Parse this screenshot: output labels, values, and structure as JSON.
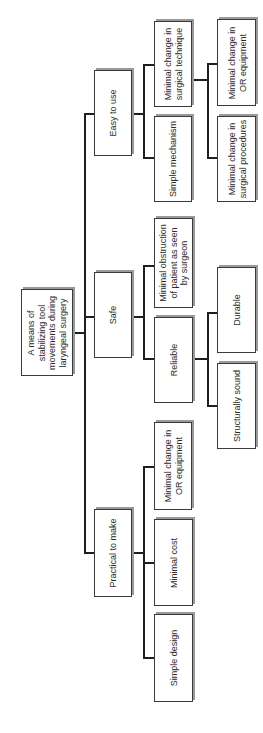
{
  "diagram": {
    "title": "A means of stabilizing tool movements during laryngeal surgery",
    "nodes": [
      {
        "id": "root",
        "label": "A means of\nstabilizing tool\nmovements during\nlaryngeal surgery",
        "x": 21,
        "y": 289,
        "w": 52,
        "h": 87
      },
      {
        "id": "easy",
        "label": "Easy to use",
        "x": 94,
        "y": 70,
        "w": 38,
        "h": 86
      },
      {
        "id": "safe",
        "label": "Safe",
        "x": 94,
        "y": 272,
        "w": 38,
        "h": 86
      },
      {
        "id": "practical",
        "label": "Practical to make",
        "x": 94,
        "y": 509,
        "w": 38,
        "h": 88
      },
      {
        "id": "technique",
        "label": "Minimal change in\nsurgical technique",
        "x": 154,
        "y": 21,
        "w": 38,
        "h": 86
      },
      {
        "id": "mechanism",
        "label": "Simple mechanism",
        "x": 154,
        "y": 116,
        "w": 38,
        "h": 86
      },
      {
        "id": "obstruction",
        "label": "Minimal obstruction\nof patient as seen\nby surgeon",
        "x": 154,
        "y": 218,
        "w": 39,
        "h": 90
      },
      {
        "id": "reliable",
        "label": "Reliable",
        "x": 154,
        "y": 317,
        "w": 39,
        "h": 86
      },
      {
        "id": "or_equipment_left",
        "label": "Minimal change in\nOR equipment",
        "x": 154,
        "y": 422,
        "w": 38,
        "h": 88
      },
      {
        "id": "cost",
        "label": "Minimal cost",
        "x": 154,
        "y": 519,
        "w": 39,
        "h": 87
      },
      {
        "id": "simple_design",
        "label": "Simple design",
        "x": 154,
        "y": 614,
        "w": 39,
        "h": 88
      },
      {
        "id": "or_equipment_right",
        "label": "Minimal change in\nOR equipment",
        "x": 217,
        "y": 19,
        "w": 39,
        "h": 87
      },
      {
        "id": "procedures",
        "label": "Minimal change in\nsurgical procedures",
        "x": 217,
        "y": 116,
        "w": 39,
        "h": 86
      },
      {
        "id": "durable",
        "label": "Durable",
        "x": 217,
        "y": 267,
        "w": 39,
        "h": 86
      },
      {
        "id": "structurally",
        "label": "Structurally sound",
        "x": 217,
        "y": 363,
        "w": 39,
        "h": 86
      }
    ],
    "edges": [
      {
        "from": "root",
        "to": "easy"
      },
      {
        "from": "root",
        "to": "safe"
      },
      {
        "from": "root",
        "to": "practical"
      },
      {
        "from": "easy",
        "to": "technique"
      },
      {
        "from": "easy",
        "to": "mechanism"
      },
      {
        "from": "technique",
        "to": "or_equipment_right"
      },
      {
        "from": "technique",
        "to": "procedures"
      },
      {
        "from": "safe",
        "to": "obstruction"
      },
      {
        "from": "safe",
        "to": "reliable"
      },
      {
        "from": "reliable",
        "to": "durable"
      },
      {
        "from": "reliable",
        "to": "structurally"
      },
      {
        "from": "practical",
        "to": "or_equipment_left"
      },
      {
        "from": "practical",
        "to": "cost"
      },
      {
        "from": "practical",
        "to": "simple_design"
      }
    ],
    "lines": [
      {
        "x": 73,
        "y": 332,
        "w": 12,
        "h": 1.5
      },
      {
        "x": 84,
        "y": 113,
        "w": 1.5,
        "h": 440
      },
      {
        "x": 84,
        "y": 113,
        "w": 10,
        "h": 1.5
      },
      {
        "x": 84,
        "y": 316,
        "w": 10,
        "h": 1.5
      },
      {
        "x": 84,
        "y": 552,
        "w": 10,
        "h": 1.5
      },
      {
        "x": 132,
        "y": 113,
        "w": 12,
        "h": 1.5
      },
      {
        "x": 143,
        "y": 64,
        "w": 1.5,
        "h": 94
      },
      {
        "x": 143,
        "y": 64,
        "w": 11,
        "h": 1.5
      },
      {
        "x": 143,
        "y": 157,
        "w": 11,
        "h": 1.5
      },
      {
        "x": 192,
        "y": 79,
        "w": 16,
        "h": 1.5
      },
      {
        "x": 207,
        "y": 63,
        "w": 1.5,
        "h": 95
      },
      {
        "x": 207,
        "y": 63,
        "w": 10,
        "h": 1.5
      },
      {
        "x": 207,
        "y": 157,
        "w": 10,
        "h": 1.5
      },
      {
        "x": 132,
        "y": 316,
        "w": 12,
        "h": 1.5
      },
      {
        "x": 143,
        "y": 265,
        "w": 1.5,
        "h": 94
      },
      {
        "x": 143,
        "y": 265,
        "w": 11,
        "h": 1.5
      },
      {
        "x": 143,
        "y": 358,
        "w": 11,
        "h": 1.5
      },
      {
        "x": 193,
        "y": 358,
        "w": 15,
        "h": 1.5
      },
      {
        "x": 207,
        "y": 312,
        "w": 1.5,
        "h": 94
      },
      {
        "x": 207,
        "y": 312,
        "w": 10,
        "h": 1.5
      },
      {
        "x": 207,
        "y": 405,
        "w": 10,
        "h": 1.5
      },
      {
        "x": 132,
        "y": 552,
        "w": 12,
        "h": 1.5
      },
      {
        "x": 143,
        "y": 466,
        "w": 1.5,
        "h": 193
      },
      {
        "x": 143,
        "y": 466,
        "w": 11,
        "h": 1.5
      },
      {
        "x": 143,
        "y": 562,
        "w": 11,
        "h": 1.5
      },
      {
        "x": 143,
        "y": 657,
        "w": 11,
        "h": 1.5
      }
    ],
    "colors": {
      "border": "#3a3a3a",
      "shadow": "#9a9a9a",
      "line": "#1f1f1f",
      "text": "#2a2a2a",
      "background": "#ffffff"
    }
  }
}
